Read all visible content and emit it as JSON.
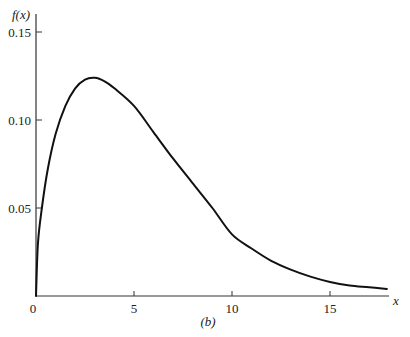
{
  "chart_data": {
    "type": "line",
    "title": "",
    "caption": "(b)",
    "xlabel": "x",
    "ylabel": "f(x)",
    "xlim": [
      0,
      18
    ],
    "ylim": [
      0,
      0.15
    ],
    "grid": false,
    "legend": null,
    "x_ticks": [
      0,
      5,
      10,
      15
    ],
    "x_tick_labels": [
      "0",
      "5",
      "10",
      "15"
    ],
    "y_ticks": [
      0.05,
      0.1,
      0.15
    ],
    "y_tick_labels": [
      "0.05",
      "0.10",
      "0.15"
    ],
    "series": [
      {
        "name": "f(x)",
        "color": "#111111",
        "x": [
          0,
          0.1,
          0.3,
          0.6,
          1.0,
          1.5,
          2.0,
          2.5,
          3.0,
          3.5,
          4.0,
          5.0,
          6.0,
          7.0,
          8.0,
          9.0,
          10.0,
          11.0,
          12.0,
          13.0,
          14.0,
          15.0,
          16.0,
          17.0,
          17.9
        ],
        "values": [
          0,
          0.03,
          0.05,
          0.072,
          0.092,
          0.108,
          0.118,
          0.123,
          0.124,
          0.122,
          0.118,
          0.108,
          0.093,
          0.078,
          0.064,
          0.05,
          0.035,
          0.027,
          0.02,
          0.015,
          0.011,
          0.008,
          0.006,
          0.005,
          0.004
        ]
      }
    ]
  },
  "labels": {
    "ylabel": "f(x)",
    "xlabel": "x",
    "caption": "(b)"
  }
}
